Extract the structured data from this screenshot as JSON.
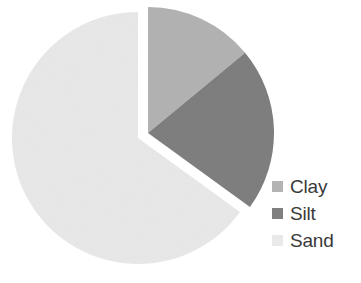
{
  "chart_data": {
    "type": "pie",
    "title": "",
    "subtitle": "",
    "xlabel": "",
    "ylabel": "",
    "grid": false,
    "legend_position": "right",
    "start_angle_deg": 0,
    "direction": "clockwise",
    "explode_group": [
      "Clay",
      "Silt"
    ],
    "categories": [
      "Clay",
      "Silt",
      "Sand"
    ],
    "values": [
      14,
      21,
      65
    ],
    "units": "percent",
    "slices": [
      {
        "label": "Clay",
        "value": 14,
        "color": "#b3b3b3",
        "exploded": true,
        "start_angle_deg": 0,
        "end_angle_deg": 50.4
      },
      {
        "label": "Silt",
        "value": 21,
        "color": "#7f7f7f",
        "exploded": true,
        "start_angle_deg": 50.4,
        "end_angle_deg": 126.0
      },
      {
        "label": "Sand",
        "value": 65,
        "color": "#e9e9e9",
        "exploded": false,
        "start_angle_deg": 126.0,
        "end_angle_deg": 360.0
      }
    ],
    "annotations": []
  },
  "legend": {
    "items": [
      {
        "label": "Clay",
        "color": "#b3b3b3",
        "swatch_icon": "square-swatch-icon"
      },
      {
        "label": "Silt",
        "color": "#7f7f7f",
        "swatch_icon": "square-swatch-icon"
      },
      {
        "label": "Sand",
        "color": "#e9e9e9",
        "swatch_icon": "square-swatch-icon"
      }
    ]
  },
  "colors": {
    "clay": "#b3b3b3",
    "silt": "#7f7f7f",
    "sand": "#e9e9e9",
    "background": "#ffffff",
    "text": "#3a3a3a",
    "slice_gap": "#ffffff"
  }
}
